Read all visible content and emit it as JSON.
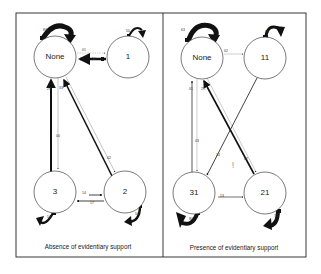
{
  "figure": {
    "panels": [
      {
        "id": "absence",
        "caption": "Absence of evidentiary support",
        "nodes": [
          {
            "id": "None",
            "label": "None",
            "cx": 55,
            "cy": 57,
            "r": 21
          },
          {
            "id": "1",
            "label": "1",
            "cx": 128,
            "cy": 57,
            "r": 21
          },
          {
            "id": "3",
            "label": "3",
            "cx": 55,
            "cy": 192,
            "r": 21
          },
          {
            "id": "2",
            "label": "2",
            "cx": 125,
            "cy": 192,
            "r": 21
          }
        ],
        "self_loops": [
          {
            "node": "None",
            "label": "84",
            "weight": "heavy"
          },
          {
            "node": "1",
            "label": "50",
            "weight": "medium"
          },
          {
            "node": "3",
            "label": "57",
            "weight": "medium"
          },
          {
            "node": "2",
            "label": "50",
            "weight": "medium"
          }
        ],
        "edges": [
          {
            "from": "None",
            "to": "1",
            "label": "01",
            "weight": "light"
          },
          {
            "from": "1",
            "to": "None",
            "label": "50",
            "weight": "heavy"
          },
          {
            "from": "3",
            "to": "None",
            "label": "29",
            "weight": "heavy"
          },
          {
            "from": "None",
            "to": "3",
            "label": "00",
            "weight": "light"
          },
          {
            "from": "2",
            "to": "None",
            "label": "33",
            "weight": "heavy"
          },
          {
            "from": "None",
            "to": "2",
            "label": "02",
            "weight": "light"
          },
          {
            "from": "3",
            "to": "2",
            "label": "14",
            "weight": "medium"
          },
          {
            "from": "2",
            "to": "3",
            "label": "17",
            "weight": "medium"
          }
        ]
      },
      {
        "id": "presence",
        "caption": "Presence of evidentiary support",
        "nodes": [
          {
            "id": "None",
            "label": "None",
            "cx": 202,
            "cy": 58,
            "r": 21
          },
          {
            "id": "11",
            "label": "11",
            "cx": 265,
            "cy": 58,
            "r": 21
          },
          {
            "id": "31",
            "label": "31",
            "cx": 194,
            "cy": 193,
            "r": 21
          },
          {
            "id": "21",
            "label": "21",
            "cx": 265,
            "cy": 193,
            "r": 21
          }
        ],
        "self_loops": [
          {
            "node": "None",
            "label": "63",
            "weight": "heavy"
          },
          {
            "node": "11",
            "label": "85",
            "weight": "medium"
          },
          {
            "node": "31",
            "label": "80",
            "weight": "heavy"
          },
          {
            "node": "21",
            "label": "71",
            "weight": "heavy"
          }
        ],
        "edges": [
          {
            "from": "None",
            "to": "11",
            "label": "02",
            "weight": "light"
          },
          {
            "from": "31",
            "to": "None",
            "label": "01",
            "weight": "medium"
          },
          {
            "from": "None",
            "to": "31",
            "label": "03",
            "weight": "light"
          },
          {
            "from": "21",
            "to": "None",
            "label": "29",
            "weight": "heavy"
          },
          {
            "from": "None",
            "to": "21",
            "label": "07",
            "weight": "light"
          },
          {
            "from": "11",
            "to": "31",
            "label": "14",
            "weight": "medium"
          },
          {
            "from": "31",
            "to": "21",
            "label": "13",
            "weight": "medium"
          }
        ],
        "annotations": [
          {
            "text": "I̧",
            "x": 233,
            "y": 165
          }
        ]
      }
    ],
    "colors": {
      "stroke": "#111111",
      "light_stroke": "#888888",
      "frame": "#222222",
      "background": "#ffffff"
    }
  }
}
